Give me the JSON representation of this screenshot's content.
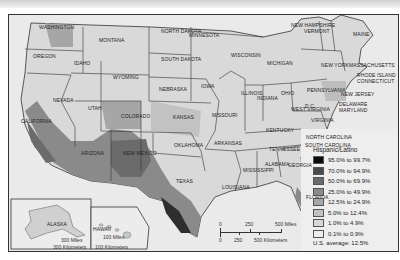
{
  "map": {
    "title": "Hispanic/Latino",
    "states": [
      {
        "name": "WASHINGTON",
        "x": 38,
        "y": 24
      },
      {
        "name": "OREGON",
        "x": 32,
        "y": 53
      },
      {
        "name": "IDAHO",
        "x": 73,
        "y": 60
      },
      {
        "name": "MONTANA",
        "x": 98,
        "y": 37
      },
      {
        "name": "WYOMING",
        "x": 112,
        "y": 74
      },
      {
        "name": "NEVADA",
        "x": 52,
        "y": 97
      },
      {
        "name": "UTAH",
        "x": 87,
        "y": 105
      },
      {
        "name": "CALIFORNIA",
        "x": 20,
        "y": 118
      },
      {
        "name": "COLORADO",
        "x": 120,
        "y": 113
      },
      {
        "name": "ARIZONA",
        "x": 80,
        "y": 150
      },
      {
        "name": "NEW MEXICO",
        "x": 122,
        "y": 150
      },
      {
        "name": "NORTH DAKOTA",
        "x": 160,
        "y": 28
      },
      {
        "name": "SOUTH DAKOTA",
        "x": 160,
        "y": 56
      },
      {
        "name": "NEBRASKA",
        "x": 158,
        "y": 86
      },
      {
        "name": "KANSAS",
        "x": 172,
        "y": 114
      },
      {
        "name": "OKLAHOMA",
        "x": 173,
        "y": 142
      },
      {
        "name": "TEXAS",
        "x": 175,
        "y": 178
      },
      {
        "name": "MINNESOTA",
        "x": 188,
        "y": 32
      },
      {
        "name": "IOWA",
        "x": 200,
        "y": 83
      },
      {
        "name": "MISSOURI",
        "x": 211,
        "y": 112
      },
      {
        "name": "ARKANSAS",
        "x": 213,
        "y": 140
      },
      {
        "name": "LOUISIANA",
        "x": 221,
        "y": 184
      },
      {
        "name": "WISCONSIN",
        "x": 230,
        "y": 52
      },
      {
        "name": "ILLINOIS",
        "x": 240,
        "y": 90
      },
      {
        "name": "MICHIGAN",
        "x": 266,
        "y": 60
      },
      {
        "name": "INDIANA",
        "x": 256,
        "y": 95
      },
      {
        "name": "OHIO",
        "x": 280,
        "y": 90
      },
      {
        "name": "KENTUCKY",
        "x": 265,
        "y": 127
      },
      {
        "name": "TENNESSEE",
        "x": 268,
        "y": 146
      },
      {
        "name": "MISSISSIPPI",
        "x": 242,
        "y": 167
      },
      {
        "name": "ALABAMA",
        "x": 264,
        "y": 161
      },
      {
        "name": "GEORGIA",
        "x": 287,
        "y": 162
      },
      {
        "name": "FLORIDA",
        "x": 305,
        "y": 194
      },
      {
        "name": "SOUTH CAROLINA",
        "x": 304,
        "y": 142
      },
      {
        "name": "NORTH CAROLINA",
        "x": 305,
        "y": 134
      },
      {
        "name": "WEST VIRGINIA",
        "x": 290,
        "y": 106
      },
      {
        "name": "VIRGINIA",
        "x": 310,
        "y": 117
      },
      {
        "name": "D.C.",
        "x": 304,
        "y": 103
      },
      {
        "name": "PENNSYLVANIA",
        "x": 306,
        "y": 87
      },
      {
        "name": "NEW YORK",
        "x": 320,
        "y": 62
      },
      {
        "name": "NEW JERSEY",
        "x": 340,
        "y": 91
      },
      {
        "name": "DELAWARE",
        "x": 338,
        "y": 101
      },
      {
        "name": "MARYLAND",
        "x": 338,
        "y": 107
      },
      {
        "name": "NEW HAMPSHIRE",
        "x": 290,
        "y": 22
      },
      {
        "name": "VERMONT",
        "x": 303,
        "y": 28
      },
      {
        "name": "MAINE",
        "x": 352,
        "y": 31
      },
      {
        "name": "MASSACHUSETTS",
        "x": 348,
        "y": 62
      },
      {
        "name": "RHODE ISLAND",
        "x": 356,
        "y": 72
      },
      {
        "name": "CONNECTICUT",
        "x": 356,
        "y": 78
      }
    ],
    "insets": {
      "alaska": {
        "label": "ALASKA",
        "scale_miles": "300 Miles",
        "scale_km": "300 Kilometers"
      },
      "hawaii": {
        "label": "HAWAII",
        "scale_miles": "100 Miles",
        "scale_km": "100 Kilometers"
      }
    },
    "scale_bar": {
      "miles_ticks": [
        "0",
        "250",
        "500 Miles"
      ],
      "km_ticks": [
        "0",
        "250",
        "500 Kilometers"
      ]
    }
  },
  "legend": {
    "title": "Hispanic/Latino",
    "items": [
      {
        "label": "95.0% to 99.7%",
        "color": "#0a0a0a"
      },
      {
        "label": "70.0% to 94.9%",
        "color": "#4a4a4a"
      },
      {
        "label": "50.0% to 69.9%",
        "color": "#6b6b6b"
      },
      {
        "label": "25.0% to 49.9%",
        "color": "#8a8a8a"
      },
      {
        "label": "12.5% to 24.9%",
        "color": "#a6a6a6"
      },
      {
        "label": "5.0% to 12.4%",
        "color": "#c2c2c2"
      },
      {
        "label": "1.0% to 4.9%",
        "color": "#d8d8d8"
      },
      {
        "label": "0.1% to 0.9%",
        "color": "#ededed"
      }
    ],
    "average_label": "U.S. average: 12.5%"
  }
}
